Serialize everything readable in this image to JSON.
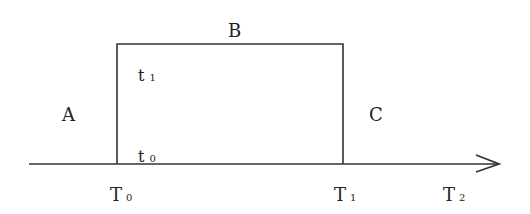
{
  "diagram": {
    "type": "timeline-interval",
    "colors": {
      "line": "#333333",
      "text": "#222222",
      "background": "#ffffff"
    },
    "regions": {
      "left": "A",
      "top": "B",
      "right": "C"
    },
    "inner_labels": {
      "upper": {
        "base": "t",
        "sub": "1"
      },
      "lower": {
        "base": "t",
        "sub": "0"
      }
    },
    "axis": {
      "ticks": [
        {
          "base": "T",
          "sub": "0"
        },
        {
          "base": "T",
          "sub": "1"
        },
        {
          "base": "T",
          "sub": "2"
        }
      ],
      "arrow": "right-arrow"
    }
  }
}
